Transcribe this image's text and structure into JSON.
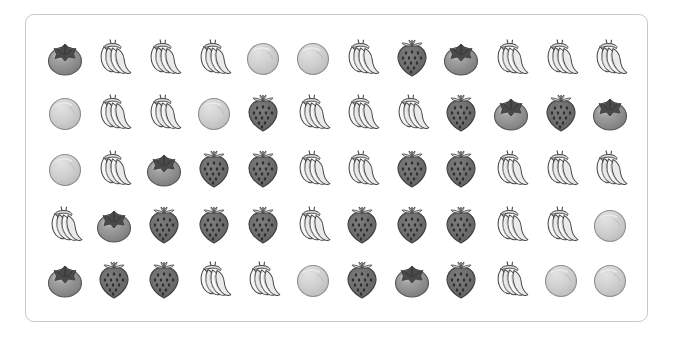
{
  "panel": {
    "border_color": "#c7c7c7",
    "background_color": "#ffffff",
    "rows": 5,
    "columns": 12
  },
  "legend": {
    "fruit_types": [
      "persimmon",
      "banana",
      "orange",
      "strawberry"
    ],
    "persimmon_body_color": "#8f8f8f",
    "persimmon_calyx_color": "#4a4a4a",
    "banana_body_color": "#f4f4f4",
    "banana_outline_color": "#4a4a4a",
    "orange_body_color": "#cfcfcf",
    "orange_outline_color": "#8a8a8a",
    "strawberry_body_color": "#6e6e6e",
    "strawberry_seed_color": "#2f2f2f"
  },
  "grid": {
    "rows": [
      {
        "index": 1,
        "cells": [
          "persimmon",
          "banana",
          "banana",
          "banana",
          "orange",
          "orange",
          "banana",
          "strawberry",
          "persimmon",
          "banana",
          "banana",
          "banana"
        ]
      },
      {
        "index": 2,
        "cells": [
          "orange",
          "banana",
          "banana",
          "orange",
          "strawberry",
          "banana",
          "banana",
          "banana",
          "strawberry",
          "persimmon",
          "strawberry",
          "persimmon"
        ]
      },
      {
        "index": 3,
        "cells": [
          "orange",
          "banana",
          "persimmon",
          "strawberry",
          "strawberry",
          "banana",
          "banana",
          "strawberry",
          "strawberry",
          "banana",
          "banana",
          "banana"
        ]
      },
      {
        "index": 4,
        "cells": [
          "banana",
          "persimmon",
          "strawberry",
          "strawberry",
          "strawberry",
          "banana",
          "strawberry",
          "strawberry",
          "strawberry",
          "banana",
          "banana",
          "orange"
        ]
      },
      {
        "index": 5,
        "cells": [
          "persimmon",
          "strawberry",
          "strawberry",
          "banana",
          "banana",
          "orange",
          "strawberry",
          "persimmon",
          "strawberry",
          "banana",
          "orange",
          "orange"
        ]
      }
    ]
  },
  "counts": {
    "persimmon": 8,
    "banana": 26,
    "orange": 8,
    "strawberry": 18,
    "total": 60
  }
}
